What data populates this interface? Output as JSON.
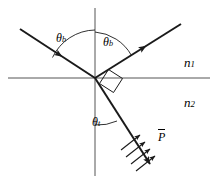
{
  "figure": {
    "stroke_color": "#1a1a1a",
    "axis_color": "#555555",
    "background": "#ffffff"
  },
  "labels": {
    "incident_angle": {
      "symbol": "θ",
      "subscript": "b",
      "x": 56,
      "y": 32
    },
    "reflected_angle": {
      "symbol": "θ",
      "subscript": "b",
      "x": 103,
      "y": 36
    },
    "refracted_angle": {
      "symbol": "θ",
      "subscript": "t",
      "x": 92,
      "y": 116
    },
    "medium_upper": {
      "symbol": "n",
      "subscript": "1",
      "x": 184,
      "y": 56
    },
    "medium_lower": {
      "symbol": "n",
      "subscript": "2",
      "x": 184,
      "y": 96
    },
    "poynting_vector": {
      "symbol": "P",
      "overbar": true,
      "x": 158,
      "y": 129
    }
  },
  "geometry": {
    "origin": {
      "x": 95,
      "y": 78
    },
    "interface_line": {
      "x1": 8,
      "y1": 78,
      "x2": 210,
      "y2": 78
    },
    "normal_line": {
      "x1": 95,
      "y1": 8,
      "x2": 95,
      "y2": 176
    },
    "incident_ray": {
      "x1": 20,
      "y1": 29,
      "x2": 95,
      "y2": 78
    },
    "reflected_ray": {
      "x1": 95,
      "y1": 78,
      "x2": 181,
      "y2": 24
    },
    "refracted_ray": {
      "x1": 95,
      "y1": 78,
      "x2": 153,
      "y2": 169
    },
    "right_angle_marker": true,
    "polarization_ticks": 4
  },
  "annotations": {
    "incident_arrow_position": "mid-ray",
    "reflected_arrow_position": "mid-ray",
    "refracted_arrow_position": "end-of-ray"
  }
}
